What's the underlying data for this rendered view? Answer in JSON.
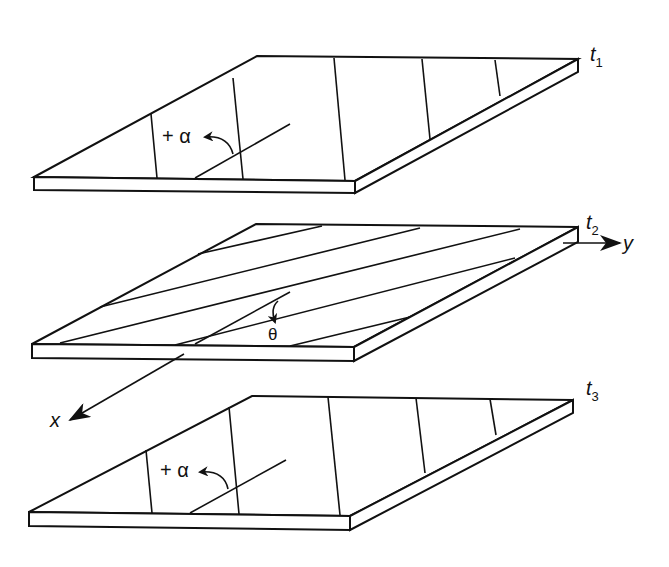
{
  "figure": {
    "layers": [
      {
        "id": "ply-1",
        "thickness_label": "t",
        "thickness_sub": "1",
        "angle_label": "+ α",
        "fiber_orientation": "+alpha"
      },
      {
        "id": "ply-2",
        "thickness_label": "t",
        "thickness_sub": "2",
        "angle_label": "θ",
        "fiber_orientation": "theta"
      },
      {
        "id": "ply-3",
        "thickness_label": "t",
        "thickness_sub": "3",
        "angle_label": "+ α",
        "fiber_orientation": "+alpha"
      }
    ],
    "axes": {
      "x_label": "x",
      "y_label": "y"
    },
    "colors": {
      "line": "#111111",
      "background": "#ffffff"
    }
  }
}
